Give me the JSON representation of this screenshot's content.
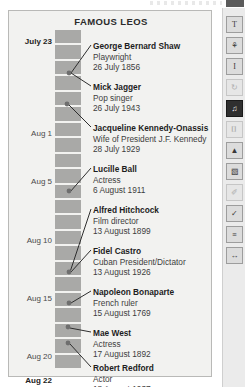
{
  "figure": {
    "title": "FAMOUS LEOS",
    "axis_labels": [
      {
        "text": "July 23",
        "bold": true,
        "top": 26
      },
      {
        "text": "Aug 1",
        "bold": false,
        "top": 118
      },
      {
        "text": "Aug 5",
        "bold": false,
        "top": 166
      },
      {
        "text": "Aug 10",
        "bold": false,
        "top": 225
      },
      {
        "text": "Aug 15",
        "bold": false,
        "top": 283
      },
      {
        "text": "Aug 20",
        "bold": false,
        "top": 341
      },
      {
        "text": "Aug 22",
        "bold": true,
        "top": 365
      }
    ],
    "entries": [
      {
        "name": "George Bernard Shaw",
        "role": "Playwright",
        "date": "26 July 1856",
        "top": 30
      },
      {
        "name": "Mick Jagger",
        "role": "Pop singer",
        "date": "26 July 1943",
        "top": 71
      },
      {
        "name": "Jacqueline Kennedy-Onassis",
        "role": "Wife of President J.F. Kennedy",
        "date": "28 July 1929",
        "top": 112
      },
      {
        "name": "Lucille Ball",
        "role": "Actress",
        "date": "6 August 1911",
        "top": 153
      },
      {
        "name": "Alfred Hitchcock",
        "role": "Film director",
        "date": "13 August 1899",
        "top": 194
      },
      {
        "name": "Fidel Castro",
        "role": "Cuban President/Dictator",
        "date": "13 August 1926",
        "top": 235
      },
      {
        "name": "Napoleon Bonaparte",
        "role": "French ruler",
        "date": "15 August 1769",
        "top": 276
      },
      {
        "name": "Mae West",
        "role": "Actress",
        "date": "17 August 1892",
        "top": 317
      },
      {
        "name": "Robert Redford",
        "role": "Actor",
        "date": "18 August 1937",
        "top": 352
      }
    ],
    "markers": [
      {
        "label": "marker-26-july-1856",
        "cx": 60,
        "cy": 62
      },
      {
        "label": "marker-26-july-1943",
        "cx": 58,
        "cy": 93
      },
      {
        "label": "marker-6-august-1911",
        "cx": 60,
        "cy": 180
      },
      {
        "label": "marker-13-august-1926",
        "cx": 60,
        "cy": 261
      },
      {
        "label": "marker-15-august-1769",
        "cx": 60,
        "cy": 292
      },
      {
        "label": "marker-17-august-1892",
        "cx": 59,
        "cy": 316
      },
      {
        "label": "marker-18-august-1937",
        "cx": 59,
        "cy": 332
      }
    ],
    "leaders": [
      {
        "label": "leader-george-bernard-shaw",
        "x1": 62,
        "y1": 62,
        "x2": 82,
        "y2": 34
      },
      {
        "label": "leader-mick-jagger",
        "x1": 62,
        "y1": 62,
        "x2": 82,
        "y2": 75
      },
      {
        "label": "leader-jacqueline-kennedy-onassis",
        "x1": 60,
        "y1": 94,
        "x2": 82,
        "y2": 116
      },
      {
        "label": "leader-lucille-ball",
        "x1": 61,
        "y1": 181,
        "x2": 82,
        "y2": 157
      },
      {
        "label": "leader-alfred-hitchcock",
        "x1": 61,
        "y1": 261,
        "x2": 82,
        "y2": 198
      },
      {
        "label": "leader-fidel-castro",
        "x1": 62,
        "y1": 261,
        "x2": 82,
        "y2": 239
      },
      {
        "label": "leader-napoleon-bonaparte",
        "x1": 62,
        "y1": 292,
        "x2": 82,
        "y2": 280
      },
      {
        "label": "leader-mae-west",
        "x1": 61,
        "y1": 317,
        "x2": 82,
        "y2": 321
      },
      {
        "label": "leader-robert-redford",
        "x1": 61,
        "y1": 333,
        "x2": 82,
        "y2": 356
      }
    ],
    "tick_count": 22,
    "colors": {
      "card_background": "#f2f2f0",
      "card_border": "#b9b9b7",
      "bar_fill": "#a9a9a7",
      "marker": "#6e6e6e",
      "leader_line": "#2e2e2e",
      "name_text": "#1d1d1d",
      "body_text": "#3d3d3d"
    }
  },
  "toolbar": {
    "items": [
      {
        "name": "text-tool",
        "glyph": "T",
        "state": "normal",
        "top": 8
      },
      {
        "name": "fill-tool",
        "glyph": "⚘",
        "state": "normal",
        "top": 29
      },
      {
        "name": "text-frame-tool",
        "glyph": "I",
        "state": "normal",
        "top": 50
      },
      {
        "name": "refresh-tool",
        "glyph": "↻",
        "state": "dim",
        "top": 71
      },
      {
        "name": "chart-tool",
        "glyph": "♫",
        "state": "active",
        "top": 92
      },
      {
        "name": "table-tool",
        "glyph": "⌷",
        "state": "dim",
        "top": 113
      },
      {
        "name": "image-tool",
        "glyph": "▲",
        "state": "normal",
        "top": 134
      },
      {
        "name": "shape-tool",
        "glyph": "▧",
        "state": "normal",
        "top": 155
      },
      {
        "name": "pencil-tool",
        "glyph": "✐",
        "state": "dim",
        "top": 176
      },
      {
        "name": "check-tool",
        "glyph": "✓",
        "state": "normal",
        "top": 197
      },
      {
        "name": "note-tool",
        "glyph": "≡",
        "state": "normal",
        "top": 218
      },
      {
        "name": "resize-tool",
        "glyph": "↔",
        "state": "normal",
        "top": 239
      }
    ]
  }
}
